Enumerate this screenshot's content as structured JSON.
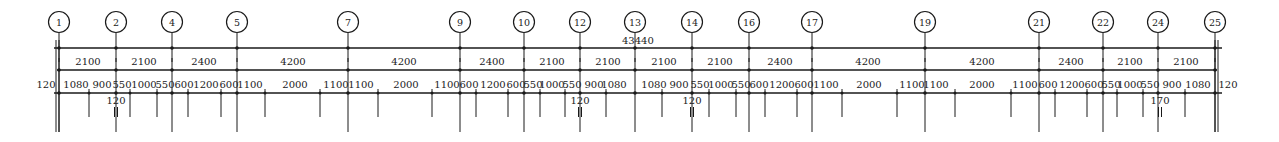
{
  "drawing": {
    "type": "architectural-dimension-chain",
    "total_dimension": "43440",
    "axes": [
      {
        "label": "1",
        "x": 59
      },
      {
        "label": "2",
        "x": 116
      },
      {
        "label": "4",
        "x": 172
      },
      {
        "label": "5",
        "x": 237
      },
      {
        "label": "7",
        "x": 348
      },
      {
        "label": "9",
        "x": 460
      },
      {
        "label": "10",
        "x": 524
      },
      {
        "label": "12",
        "x": 580
      },
      {
        "label": "13",
        "x": 635
      },
      {
        "label": "14",
        "x": 692
      },
      {
        "label": "16",
        "x": 749
      },
      {
        "label": "17",
        "x": 812
      },
      {
        "label": "19",
        "x": 925
      },
      {
        "label": "21",
        "x": 1039
      },
      {
        "label": "22",
        "x": 1103
      },
      {
        "label": "24",
        "x": 1158
      },
      {
        "label": "25",
        "x": 1215
      }
    ],
    "axis_spacing_row": [
      {
        "text": "2100",
        "x": 88
      },
      {
        "text": "2100",
        "x": 144
      },
      {
        "text": "2400",
        "x": 204
      },
      {
        "text": "4200",
        "x": 293
      },
      {
        "text": "4200",
        "x": 404
      },
      {
        "text": "2400",
        "x": 492
      },
      {
        "text": "2100",
        "x": 552
      },
      {
        "text": "2100",
        "x": 608
      },
      {
        "text": "2100",
        "x": 664
      },
      {
        "text": "2100",
        "x": 720
      },
      {
        "text": "2400",
        "x": 780
      },
      {
        "text": "4200",
        "x": 868
      },
      {
        "text": "4200",
        "x": 982
      },
      {
        "text": "2400",
        "x": 1071
      },
      {
        "text": "2100",
        "x": 1130
      },
      {
        "text": "2100",
        "x": 1186
      }
    ],
    "detail_row": [
      {
        "text": "120",
        "x": 46
      },
      {
        "text": "1080",
        "x": 76
      },
      {
        "text": "900",
        "x": 102
      },
      {
        "text": "550",
        "x": 122
      },
      {
        "text": "1000",
        "x": 144
      },
      {
        "text": "550",
        "x": 165
      },
      {
        "text": "600",
        "x": 184
      },
      {
        "text": "1200",
        "x": 206
      },
      {
        "text": "600",
        "x": 229
      },
      {
        "text": "1100",
        "x": 250
      },
      {
        "text": "2000",
        "x": 295
      },
      {
        "text": "1100",
        "x": 336
      },
      {
        "text": "1100",
        "x": 361
      },
      {
        "text": "2000",
        "x": 406
      },
      {
        "text": "1100",
        "x": 447
      },
      {
        "text": "600",
        "x": 469
      },
      {
        "text": "1200",
        "x": 493
      },
      {
        "text": "600",
        "x": 516
      },
      {
        "text": "550",
        "x": 533
      },
      {
        "text": "1000",
        "x": 552
      },
      {
        "text": "550",
        "x": 572
      },
      {
        "text": "900",
        "x": 594
      },
      {
        "text": "1080",
        "x": 614
      },
      {
        "text": "1080",
        "x": 654
      },
      {
        "text": "900",
        "x": 679
      },
      {
        "text": "550",
        "x": 700
      },
      {
        "text": "1000",
        "x": 721
      },
      {
        "text": "550",
        "x": 741
      },
      {
        "text": "600",
        "x": 759
      },
      {
        "text": "1200",
        "x": 782
      },
      {
        "text": "600",
        "x": 804
      },
      {
        "text": "1100",
        "x": 826
      },
      {
        "text": "2000",
        "x": 869
      },
      {
        "text": "1100",
        "x": 912
      },
      {
        "text": "1100",
        "x": 936
      },
      {
        "text": "2000",
        "x": 982
      },
      {
        "text": "1100",
        "x": 1025
      },
      {
        "text": "600",
        "x": 1048
      },
      {
        "text": "1200",
        "x": 1072
      },
      {
        "text": "600",
        "x": 1094
      },
      {
        "text": "550",
        "x": 1111
      },
      {
        "text": "1000",
        "x": 1130
      },
      {
        "text": "550",
        "x": 1150
      },
      {
        "text": "900",
        "x": 1172
      },
      {
        "text": "1080",
        "x": 1198
      },
      {
        "text": "120",
        "x": 1228
      }
    ],
    "sub_labels": [
      {
        "text": "120",
        "x": 116
      },
      {
        "text": "120",
        "x": 580
      },
      {
        "text": "120",
        "x": 692
      },
      {
        "text": "170",
        "x": 1160
      }
    ],
    "ticks": [
      89,
      130,
      157,
      188,
      221,
      265,
      320,
      378,
      432,
      476,
      508,
      540,
      565,
      606,
      662,
      709,
      736,
      765,
      797,
      842,
      897,
      955,
      1011,
      1055,
      1087,
      1117,
      1143,
      1185
    ],
    "colors": {
      "ink": "#1a1a1a",
      "background": "#ffffff"
    }
  }
}
